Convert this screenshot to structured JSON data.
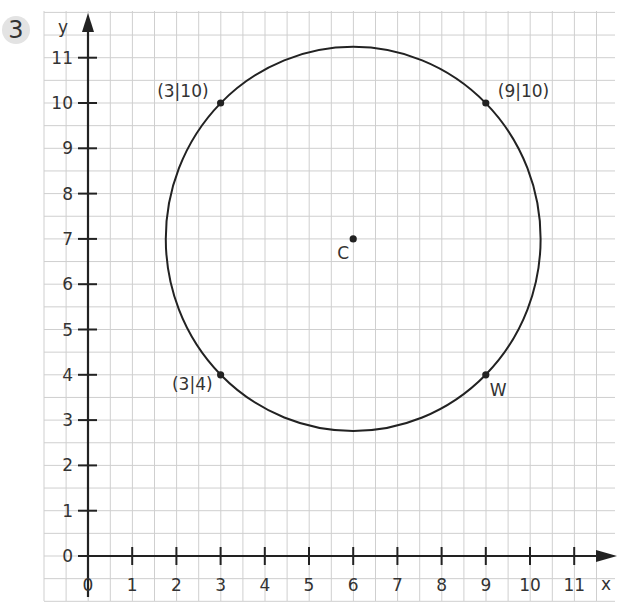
{
  "exercise_number": "3",
  "axes": {
    "x_label": "x",
    "y_label": "y",
    "x_ticks": [
      "0",
      "1",
      "2",
      "3",
      "4",
      "5",
      "6",
      "7",
      "8",
      "9",
      "10",
      "11"
    ],
    "y_ticks": [
      "0",
      "1",
      "2",
      "3",
      "4",
      "5",
      "6",
      "7",
      "8",
      "9",
      "10",
      "11"
    ]
  },
  "points": [
    {
      "id": "p1",
      "label": "(3|10)",
      "x": 3,
      "y": 10
    },
    {
      "id": "p2",
      "label": "(9|10)",
      "x": 9,
      "y": 10
    },
    {
      "id": "p3",
      "label": "(3|4)",
      "x": 3,
      "y": 4
    },
    {
      "id": "W",
      "label": "W",
      "x": 9,
      "y": 4
    },
    {
      "id": "C",
      "label": "C",
      "x": 6,
      "y": 7
    }
  ],
  "circle": {
    "center": "C",
    "cx": 6,
    "cy": 7,
    "radius": 4.24
  },
  "colors": {
    "grid": "#cfcfcf",
    "axis": "#222222",
    "curve": "#222222",
    "badge": "#e3e3e3"
  },
  "chart_data": {
    "type": "scatter",
    "title": "",
    "xlabel": "x",
    "ylabel": "y",
    "xlim": [
      0,
      11
    ],
    "ylim": [
      0,
      11
    ],
    "grid": true,
    "series": [
      {
        "name": "points",
        "x": [
          3,
          9,
          3,
          9,
          6
        ],
        "y": [
          10,
          10,
          4,
          4,
          7
        ],
        "labels": [
          "(3|10)",
          "(9|10)",
          "(3|4)",
          "W",
          "C"
        ]
      }
    ],
    "shapes": [
      {
        "type": "circle",
        "center": [
          6,
          7
        ],
        "radius": 4.24,
        "passes_through": [
          [
            3,
            10
          ],
          [
            9,
            10
          ],
          [
            3,
            4
          ],
          [
            9,
            4
          ]
        ]
      }
    ]
  }
}
